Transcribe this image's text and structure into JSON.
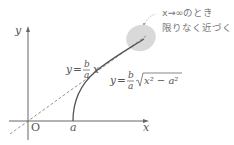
{
  "diagram": {
    "axes": {
      "x_label": "x",
      "y_label": "y",
      "origin_label": "O",
      "a_label": "a"
    },
    "asymptote": {
      "lhs": "y",
      "eq": "=",
      "frac_num": "b",
      "frac_den": "a",
      "var": "x"
    },
    "curve": {
      "lhs": "y",
      "eq": "=",
      "frac_num": "b",
      "frac_den": "a",
      "sqrt_body": "x² − a²"
    },
    "annotation": {
      "line1": "x→∞のとき",
      "line2": "限りなく近づく"
    },
    "colors": {
      "axis": "#555555",
      "curve": "#555555",
      "asymptote": "#777777",
      "highlight": "#d9d9d9",
      "text": "#555555"
    }
  }
}
